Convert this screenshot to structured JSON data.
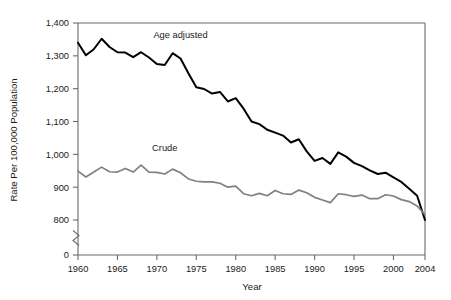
{
  "chart_data": {
    "type": "line",
    "title": "",
    "xlabel": "Year",
    "ylabel": "Rate Per 100,000 Population",
    "xlim": [
      1960,
      2004
    ],
    "ylim": [
      800,
      1400
    ],
    "yaxis_break": {
      "present": true,
      "from": 0,
      "to": 800,
      "zero_label": "0"
    },
    "grid": false,
    "legend_position": "inline-annotation",
    "xticks": [
      1960,
      1965,
      1970,
      1975,
      1980,
      1985,
      1990,
      1995,
      2000,
      2004
    ],
    "xtick_labels": [
      "1960",
      "1965",
      "1970",
      "1975",
      "1980",
      "1985",
      "1990",
      "1995",
      "2000",
      "2004"
    ],
    "yticks": [
      0,
      800,
      900,
      1000,
      1100,
      1200,
      1300,
      1400
    ],
    "ytick_labels": [
      "0",
      "800",
      "900",
      "1,000",
      "1,100",
      "1,200",
      "1,300",
      "1,400"
    ],
    "x": [
      1960,
      1961,
      1962,
      1963,
      1964,
      1965,
      1966,
      1967,
      1968,
      1969,
      1970,
      1971,
      1972,
      1973,
      1974,
      1975,
      1976,
      1977,
      1978,
      1979,
      1980,
      1981,
      1982,
      1983,
      1984,
      1985,
      1986,
      1987,
      1988,
      1989,
      1990,
      1991,
      1992,
      1993,
      1994,
      1995,
      1996,
      1997,
      1998,
      1999,
      2000,
      2001,
      2002,
      2003,
      2004
    ],
    "series": [
      {
        "name": "Age adjusted",
        "color": "#000000",
        "label_x": 1973,
        "label_y": 1355,
        "values": [
          1340,
          1302,
          1320,
          1352,
          1327,
          1311,
          1310,
          1296,
          1311,
          1295,
          1275,
          1272,
          1308,
          1292,
          1247,
          1204,
          1199,
          1185,
          1190,
          1161,
          1171,
          1139,
          1100,
          1092,
          1075,
          1066,
          1057,
          1036,
          1046,
          1009,
          980,
          989,
          971,
          1006,
          993,
          974,
          964,
          951,
          940,
          944,
          930,
          916,
          895,
          874,
          800
        ],
        "style": "solid"
      },
      {
        "name": "Crude",
        "color": "#808080",
        "label_x": 1971,
        "label_y": 1010,
        "values": [
          949,
          931,
          946,
          961,
          947,
          946,
          957,
          946,
          967,
          946,
          945,
          940,
          955,
          944,
          925,
          918,
          916,
          916,
          912,
          900,
          903,
          880,
          874,
          881,
          874,
          890,
          880,
          878,
          891,
          883,
          869,
          861,
          853,
          880,
          877,
          872,
          876,
          865,
          865,
          877,
          873,
          862,
          856,
          843,
          816
        ],
        "style": "solid"
      }
    ]
  },
  "figure": {
    "background": "#ffffff",
    "axis_color": "#6b6b6b",
    "text_color": "#1a1a1a"
  }
}
